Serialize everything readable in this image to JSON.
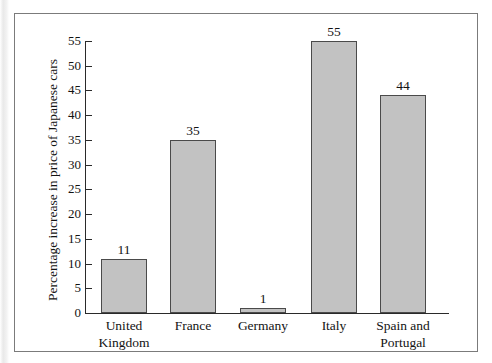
{
  "figure": {
    "border_color": "#7b7b7b",
    "background": "#ffffff"
  },
  "chart_data": {
    "type": "bar",
    "title": "",
    "subtitle": "",
    "xlabel": "",
    "ylabel": "Percentage increase in price of Japanese cars",
    "categories": [
      "United Kingdom",
      "France",
      "Germany",
      "Italy",
      "Spain and Portugal"
    ],
    "category_lines": [
      [
        "United",
        "Kingdom"
      ],
      [
        "France",
        ""
      ],
      [
        "Germany",
        ""
      ],
      [
        "Italy",
        ""
      ],
      [
        "Spain and",
        "Portugal"
      ]
    ],
    "values": [
      11,
      35,
      1,
      55,
      44
    ],
    "value_labels": [
      "11",
      "35",
      "1",
      "55",
      "44"
    ],
    "ylim": [
      0,
      55
    ],
    "ytick_values": [
      0,
      5,
      10,
      15,
      20,
      25,
      30,
      35,
      40,
      45,
      50,
      55
    ],
    "ytick_labels": [
      "0",
      "5",
      "10",
      "15",
      "20",
      "25",
      "30",
      "35",
      "40",
      "45",
      "50",
      "55"
    ],
    "grid": false,
    "legend": null,
    "bar_fill_color": "#c2c2c2",
    "bar_edge_color": "#4a4a4a",
    "axis_color": "#2a2a2a",
    "text_color": "#131313"
  }
}
